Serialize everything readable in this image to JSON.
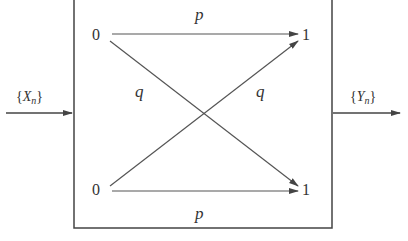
{
  "diagram": {
    "input_label": "{X_n}",
    "input_symbol": "X",
    "input_sub": "n",
    "output_label": "{Y_n}",
    "output_symbol": "Y",
    "output_sub": "n",
    "input_nodes": [
      {
        "id": "in-0-top",
        "label": "0"
      },
      {
        "id": "in-0-bottom",
        "label": "0"
      }
    ],
    "output_nodes": [
      {
        "id": "out-1-top",
        "label": "1"
      },
      {
        "id": "out-1-bottom",
        "label": "1"
      }
    ],
    "edges": [
      {
        "from": "in-0-top",
        "to": "out-1-top",
        "label": "p"
      },
      {
        "from": "in-0-top",
        "to": "out-1-bottom",
        "label": "q"
      },
      {
        "from": "in-0-bottom",
        "to": "out-1-top",
        "label": "q"
      },
      {
        "from": "in-0-bottom",
        "to": "out-1-bottom",
        "label": "p"
      }
    ],
    "line_color": "#555555"
  }
}
